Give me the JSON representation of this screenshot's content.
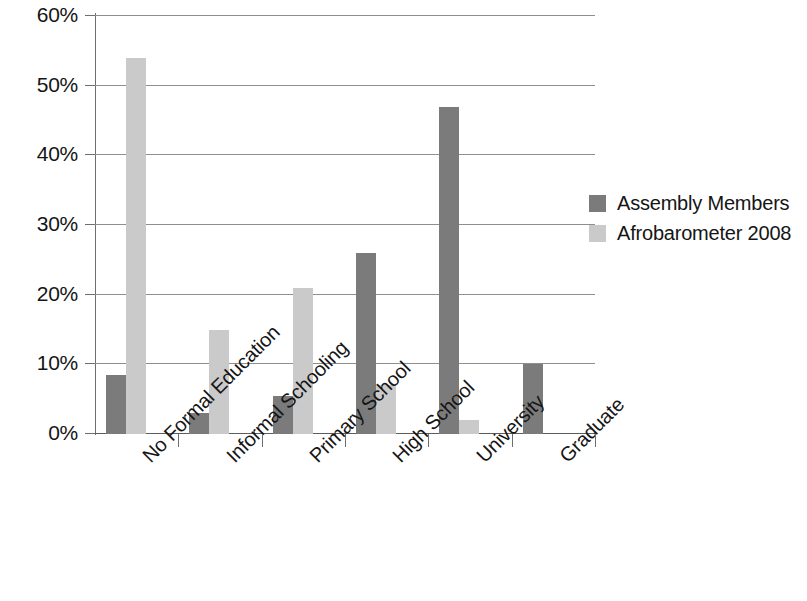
{
  "chart_data": {
    "type": "bar",
    "title": "",
    "xlabel": "",
    "ylabel": "",
    "categories": [
      "No Formal Education",
      "Informal Schooling",
      "Primary School",
      "High School",
      "University",
      "Graduate"
    ],
    "series": [
      {
        "name": "Assembly Members",
        "color": "#7b7b7b",
        "values": [
          8.5,
          3.0,
          5.5,
          26.0,
          47.0,
          10.0
        ]
      },
      {
        "name": "Afrobarometer 2008",
        "color": "#cacaca",
        "values": [
          54.0,
          15.0,
          21.0,
          7.0,
          2.0,
          0
        ]
      }
    ],
    "ylim": [
      0,
      60
    ],
    "ytick_labels": [
      "60%",
      "50%",
      "40%",
      "30%",
      "20%",
      "10%",
      "0%"
    ],
    "ytick_values": [
      60,
      50,
      40,
      30,
      20,
      10,
      0
    ],
    "ytick_step": 10,
    "grid": true,
    "legend_position": "right",
    "value_suffix": "%"
  },
  "legend": {
    "items": [
      {
        "label": "Assembly Members",
        "color": "#7b7b7b"
      },
      {
        "label": "Afrobarometer 2008",
        "color": "#cacaca"
      }
    ]
  }
}
